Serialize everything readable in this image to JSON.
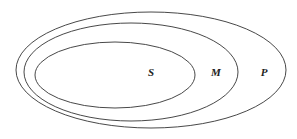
{
  "diagram": {
    "type": "nested-sets",
    "sets": [
      {
        "id": "P",
        "label": "P",
        "cx": 151,
        "cy": 70,
        "rx": 135,
        "ry": 58,
        "label_x": 264,
        "label_y": 76
      },
      {
        "id": "M",
        "label": "M",
        "cx": 131,
        "cy": 72,
        "rx": 107,
        "ry": 49,
        "label_x": 216,
        "label_y": 76
      },
      {
        "id": "S",
        "label": "S",
        "cx": 115,
        "cy": 75,
        "rx": 80,
        "ry": 33,
        "label_x": 151,
        "label_y": 76
      }
    ],
    "stroke_color": "#333333",
    "background": "#ffffff"
  }
}
